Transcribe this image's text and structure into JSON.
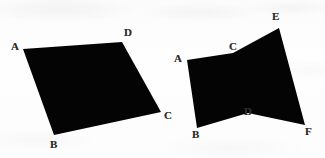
{
  "page": {
    "width": 325,
    "height": 158,
    "background_color": "#fdfdfd",
    "ink_color": "#040404",
    "label_color": "#2a2a2a"
  },
  "figures": [
    {
      "id": "left-figure",
      "name": "self-intersecting-quadrilateral-abcd",
      "shape_type": "bowtie",
      "fill_color": "#040404",
      "path": "M 23 49 L 54 135 L 161 112 L 122 42 Z",
      "vertices": [
        {
          "id": "left-a",
          "label": "A",
          "x": 23,
          "y": 49,
          "label_x": 11,
          "label_y": 41
        },
        {
          "id": "left-b",
          "label": "B",
          "x": 54,
          "y": 135,
          "label_x": 50,
          "label_y": 139
        },
        {
          "id": "left-c",
          "label": "C",
          "x": 161,
          "y": 112,
          "label_x": 164,
          "label_y": 110
        },
        {
          "id": "left-d",
          "label": "D",
          "x": 122,
          "y": 42,
          "label_x": 124,
          "label_y": 27
        }
      ]
    },
    {
      "id": "right-figure",
      "name": "concave-hexagon-acefdb",
      "shape_type": "concave-hexagon",
      "fill_color": "#040404",
      "path": "M 187 60 L 233 53 L 279 28 L 305 125 L 248 113 L 197 128 Z",
      "vertices": [
        {
          "id": "right-a",
          "label": "A",
          "x": 187,
          "y": 60,
          "label_x": 174,
          "label_y": 53
        },
        {
          "id": "right-c",
          "label": "C",
          "x": 233,
          "y": 53,
          "label_x": 229,
          "label_y": 41
        },
        {
          "id": "right-e",
          "label": "E",
          "x": 279,
          "y": 28,
          "label_x": 272,
          "label_y": 11
        },
        {
          "id": "right-f",
          "label": "F",
          "x": 305,
          "y": 125,
          "label_x": 305,
          "label_y": 126
        },
        {
          "id": "right-d",
          "label": "D",
          "x": 248,
          "y": 113,
          "label_x": 244,
          "label_y": 106
        },
        {
          "id": "right-b",
          "label": "B",
          "x": 197,
          "y": 128,
          "label_x": 192,
          "label_y": 129
        }
      ]
    }
  ]
}
